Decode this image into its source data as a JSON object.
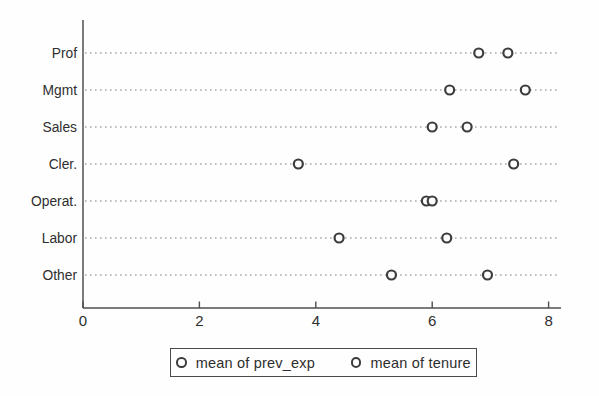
{
  "chart_data": {
    "type": "scatter",
    "variant": "horizontal-dot-plot",
    "title": "",
    "xlabel": "",
    "ylabel": "",
    "categories": [
      "Prof",
      "Mgmt",
      "Sales",
      "Cler.",
      "Operat.",
      "Labor",
      "Other"
    ],
    "series": [
      {
        "name": "mean of prev_exp",
        "values": [
          6.8,
          6.3,
          6.0,
          3.7,
          5.9,
          4.4,
          5.3
        ]
      },
      {
        "name": "mean of tenure",
        "values": [
          7.3,
          7.6,
          6.6,
          7.4,
          6.0,
          6.25,
          6.95
        ]
      }
    ],
    "x_ticks": [
      0,
      2,
      4,
      6,
      8
    ],
    "xlim": [
      0,
      8.25
    ],
    "grid": "dotted horizontal leader lines per category",
    "marker": "open-circle",
    "legend_position": "bottom-center-boxed",
    "colors": {
      "marker_stroke": "#3d3d3d",
      "marker_fill": "#fefefe",
      "dotted_line": "#a9a9a9",
      "axis": "#4f4f4f",
      "text": "#2e2e2e"
    }
  },
  "legend": {
    "items": [
      {
        "label": "mean of prev_exp"
      },
      {
        "label": "mean of tenure"
      }
    ]
  }
}
